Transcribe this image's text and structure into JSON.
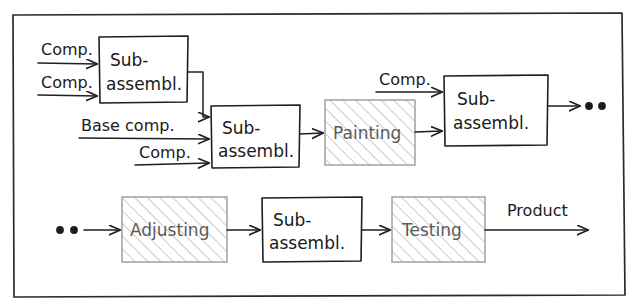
{
  "diagram": {
    "frame": {
      "present": true,
      "color": "#2b2b2b"
    },
    "colors": {
      "stroke_dark": "#1f1f1f",
      "stroke_light": "#9a9a9a",
      "text_dark": "#1a1a1a",
      "text_light": "#5a5a5a",
      "hatch": "#b4b4b4",
      "background": "#ffffff"
    },
    "nodes": [
      {
        "id": "sub1",
        "label": "Sub-\nassembl.",
        "line1": "Sub-",
        "line2": "assembl.",
        "style": "plain",
        "x": 99,
        "y": 36,
        "w": 89,
        "h": 67
      },
      {
        "id": "sub2",
        "label": "Sub-\nassembl.",
        "line1": "Sub-",
        "line2": "assembl.",
        "style": "plain",
        "x": 211,
        "y": 105,
        "w": 89,
        "h": 63
      },
      {
        "id": "painting",
        "label": "Painting",
        "line1": "Painting",
        "line2": "",
        "style": "hatched",
        "x": 325,
        "y": 100,
        "w": 90,
        "h": 65
      },
      {
        "id": "sub3",
        "label": "Sub-\nassembl.",
        "line1": "Sub-",
        "line2": "assembl.",
        "style": "plain",
        "x": 444,
        "y": 75,
        "w": 104,
        "h": 71
      },
      {
        "id": "adjusting",
        "label": "Adjusting",
        "line1": "Adjusting",
        "line2": "",
        "style": "hatched",
        "x": 122,
        "y": 197,
        "w": 105,
        "h": 65
      },
      {
        "id": "sub4",
        "label": "Sub-\nassembl.",
        "line1": "Sub-",
        "line2": "assembl.",
        "style": "plain",
        "x": 262,
        "y": 197,
        "w": 100,
        "h": 65
      },
      {
        "id": "testing",
        "label": "Testing",
        "line1": "Testing",
        "line2": "",
        "style": "hatched",
        "x": 392,
        "y": 197,
        "w": 93,
        "h": 65
      }
    ],
    "edge_labels": [
      {
        "id": "comp-top-1",
        "text": "Comp.",
        "x": 41,
        "y": 48
      },
      {
        "id": "comp-top-2",
        "text": "Comp.",
        "x": 41,
        "y": 80
      },
      {
        "id": "base-comp",
        "text": "Base comp.",
        "x": 81,
        "y": 127
      },
      {
        "id": "comp-mid",
        "text": "Comp.",
        "x": 137,
        "y": 155
      },
      {
        "id": "comp-upper",
        "text": "Comp.",
        "x": 379,
        "y": 80
      },
      {
        "id": "product",
        "text": "Product",
        "x": 505,
        "y": 213
      }
    ],
    "continuation_markers": [
      {
        "id": "cont-right-top",
        "symbol": "o o",
        "x": 586,
        "y": 107
      },
      {
        "id": "cont-left-bottom",
        "symbol": "o o",
        "x": 57,
        "y": 230
      }
    ]
  }
}
